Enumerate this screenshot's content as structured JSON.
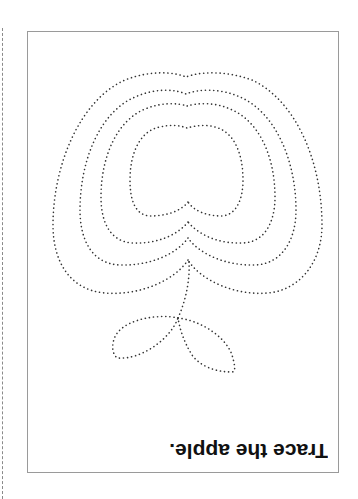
{
  "worksheet": {
    "instruction": "Trace the apple.",
    "orientation": "upside-down",
    "figure": "apple",
    "trace_paths": [
      "apple-outline-1",
      "apple-outline-2",
      "apple-outline-3",
      "apple-outline-4",
      "stem",
      "leaf-left",
      "leaf-right"
    ],
    "dot_color": "#333333",
    "border_color": "#9a9a9a",
    "cut_line_color": "#8a8a8a"
  }
}
